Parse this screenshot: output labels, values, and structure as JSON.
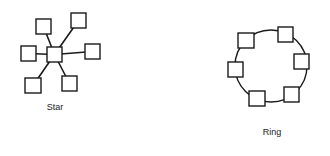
{
  "diagrams": [
    {
      "name": "star",
      "label": "Star",
      "hub": {
        "x": 47,
        "y": 47,
        "w": 15,
        "h": 15
      },
      "nodes": [
        {
          "x": 36,
          "y": 19,
          "w": 15,
          "h": 15
        },
        {
          "x": 71,
          "y": 13,
          "w": 15,
          "h": 15
        },
        {
          "x": 21,
          "y": 46,
          "w": 15,
          "h": 15
        },
        {
          "x": 85,
          "y": 44,
          "w": 15,
          "h": 15
        },
        {
          "x": 25,
          "y": 78,
          "w": 16,
          "h": 15
        },
        {
          "x": 62,
          "y": 76,
          "w": 15,
          "h": 15
        }
      ]
    },
    {
      "name": "ring",
      "label": "Ring",
      "circle": {
        "cx": 271,
        "cy": 66,
        "r": 36
      },
      "nodes": [
        {
          "x": 238,
          "y": 33,
          "w": 16,
          "h": 15
        },
        {
          "x": 278,
          "y": 27,
          "w": 15,
          "h": 15
        },
        {
          "x": 294,
          "y": 54,
          "w": 15,
          "h": 15
        },
        {
          "x": 284,
          "y": 87,
          "w": 15,
          "h": 15
        },
        {
          "x": 249,
          "y": 91,
          "w": 16,
          "h": 15
        },
        {
          "x": 228,
          "y": 62,
          "w": 15,
          "h": 15
        }
      ]
    }
  ],
  "colors": {
    "stroke": "#1a1a1a",
    "fill": "#ffffff",
    "text": "#222222"
  }
}
